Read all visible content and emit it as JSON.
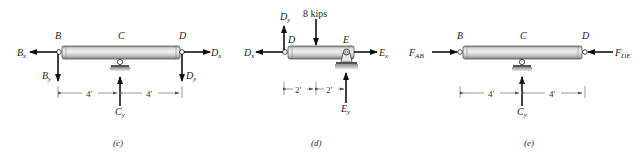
{
  "figure": {
    "panels": [
      {
        "id": "c",
        "caption": "(c)",
        "points": {
          "left": "B",
          "middle": "C",
          "right": "D"
        },
        "forces": {
          "left_horizontal": {
            "label": "B",
            "sub": "x",
            "direction": "left"
          },
          "left_vertical": {
            "label": "B",
            "sub": "y",
            "direction": "down"
          },
          "right_horizontal": {
            "label": "D",
            "sub": "x",
            "direction": "right"
          },
          "right_vertical": {
            "label": "D",
            "sub": "y",
            "direction": "down"
          },
          "support_reaction": {
            "label": "C",
            "sub": "y",
            "direction": "up"
          }
        },
        "dimensions": [
          "4′",
          "4′"
        ]
      },
      {
        "id": "d",
        "caption": "(d)",
        "points": {
          "left": "D",
          "right": "E"
        },
        "load": {
          "label": "8 kips",
          "direction": "down"
        },
        "forces": {
          "left_vertical": {
            "label": "D",
            "sub": "y",
            "direction": "up"
          },
          "left_horizontal": {
            "label": "D",
            "sub": "x",
            "direction": "left"
          },
          "right_horizontal": {
            "label": "E",
            "sub": "x",
            "direction": "right"
          },
          "support_reaction": {
            "label": "E",
            "sub": "y",
            "direction": "up"
          }
        },
        "dimensions": [
          "2′",
          "2′"
        ]
      },
      {
        "id": "e",
        "caption": "(e)",
        "points": {
          "left": "B",
          "middle": "C",
          "right": "D"
        },
        "forces": {
          "left_axial": {
            "label": "F",
            "sub": "AB",
            "direction": "right"
          },
          "right_axial": {
            "label": "F",
            "sub": "DE",
            "direction": "left"
          },
          "support_reaction": {
            "label": "C",
            "sub": "y",
            "direction": "up"
          }
        },
        "dimensions": [
          "4′",
          "4′"
        ]
      }
    ],
    "colors": {
      "beam_light": "#e6e6e6",
      "beam_mid": "#bdbdbd",
      "beam_dark": "#8a8a8a",
      "arrow": "#111111",
      "ground": "#9a9a9a"
    }
  }
}
